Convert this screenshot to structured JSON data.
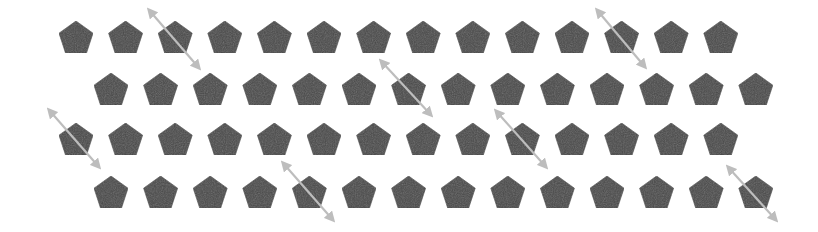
{
  "colors": {
    "background": "#ffffff",
    "pentagon_fill": "#4a4a4a",
    "pentagon_stroke": "#3a3a3a",
    "arrow": "#bdbdbd"
  },
  "pentagon": {
    "width": 34,
    "height": 32
  },
  "rows": [
    {
      "y": 21,
      "x_start": 59,
      "spacing": 49.6,
      "count": 14
    },
    {
      "y": 73,
      "x_start": 94,
      "spacing": 49.6,
      "count": 14
    },
    {
      "y": 123,
      "x_start": 59,
      "spacing": 49.6,
      "count": 14
    },
    {
      "y": 176,
      "x_start": 94,
      "spacing": 49.6,
      "count": 14
    }
  ],
  "arrows": [
    {
      "row": 1,
      "index": 3,
      "x1": 149,
      "y1": 10,
      "x2": 199,
      "y2": 68
    },
    {
      "row": 1,
      "index": 12,
      "x1": 597,
      "y1": 10,
      "x2": 645,
      "y2": 67
    },
    {
      "row": 2,
      "index": 7,
      "x1": 381,
      "y1": 61,
      "x2": 431,
      "y2": 115
    },
    {
      "row": 3,
      "index": 1,
      "x1": 49,
      "y1": 110,
      "x2": 99,
      "y2": 167
    },
    {
      "row": 3,
      "index": 10,
      "x1": 496,
      "y1": 111,
      "x2": 546,
      "y2": 167
    },
    {
      "row": 4,
      "index": 5,
      "x1": 283,
      "y1": 163,
      "x2": 333,
      "y2": 220
    },
    {
      "row": 4,
      "index": 14,
      "x1": 728,
      "y1": 167,
      "x2": 776,
      "y2": 220
    }
  ]
}
